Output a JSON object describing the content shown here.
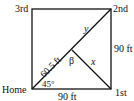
{
  "diagram": {
    "bases": {
      "home": "Home",
      "first": "1st",
      "second": "2nd",
      "third": "3rd"
    },
    "measurements": {
      "bottom_side": "90 ft",
      "right_side": "90 ft",
      "home_to_pitcher": "60.5 ft",
      "angle_home": "45°",
      "angle_pitcher": "β",
      "pitcher_to_first": "x",
      "pitcher_to_second": "y"
    },
    "colors": {
      "stroke": "#111111",
      "background": "#ffffff"
    }
  }
}
